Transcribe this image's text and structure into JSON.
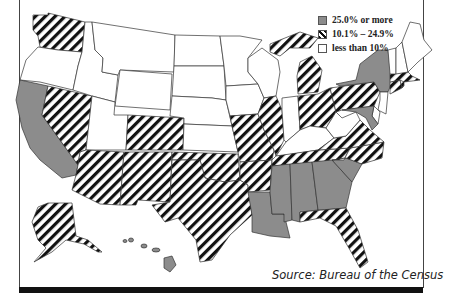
{
  "legend": {
    "items": [
      {
        "label": "25.0% or more",
        "category": "high",
        "color": "#8c8c8c"
      },
      {
        "label": "10.1% – 24.9%",
        "category": "mid",
        "pattern": "diagonal-hatch"
      },
      {
        "label": "less than 10%",
        "category": "low",
        "color": "#ffffff"
      }
    ]
  },
  "source": "Source: Bureau of the Census",
  "colors": {
    "high": "#8c8c8c",
    "hatch": "#111111",
    "low": "#ffffff",
    "border": "#333333"
  },
  "states": {
    "WA": "mid",
    "OR": "low",
    "CA": "high",
    "NV": "mid",
    "ID": "low",
    "MT": "low",
    "WY": "low",
    "UT": "low",
    "CO": "mid",
    "AZ": "mid",
    "NM": "mid",
    "ND": "low",
    "SD": "low",
    "NE": "low",
    "KS": "low",
    "OK": "mid",
    "TX": "mid",
    "MN": "low",
    "IA": "low",
    "MO": "mid",
    "AR": "mid",
    "LA": "high",
    "WI": "low",
    "IL": "mid",
    "MI": "mid",
    "IN": "low",
    "OH": "mid",
    "KY": "low",
    "TN": "mid",
    "MS": "high",
    "AL": "high",
    "GA": "high",
    "FL": "mid",
    "SC": "high",
    "NC": "mid",
    "VA": "mid",
    "WV": "low",
    "PA": "mid",
    "NY": "high",
    "NJ": "low",
    "DE": "low",
    "MD": "high",
    "CT": "mid",
    "RI": "mid",
    "MA": "mid",
    "VT": "low",
    "NH": "low",
    "ME": "low",
    "AK": "mid",
    "HI": "high"
  }
}
